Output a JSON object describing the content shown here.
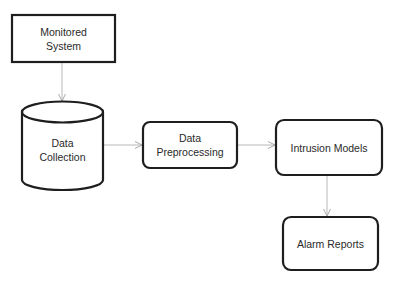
{
  "diagram": {
    "colors": {
      "node_stroke": "#1e1e1e",
      "node_fill": "#ffffff",
      "edge_stroke": "#b8b8b8",
      "text": "#2a2a2a",
      "background": "#ffffff"
    },
    "nodes": [
      {
        "id": "monitored-system",
        "shape": "rectangle",
        "label": "Monitored\nSystem"
      },
      {
        "id": "data-collection",
        "shape": "cylinder",
        "label": "Data\nCollection"
      },
      {
        "id": "data-preprocessing",
        "shape": "rounded-rectangle",
        "label": "Data\nPreprocessing"
      },
      {
        "id": "intrusion-models",
        "shape": "rounded-rectangle",
        "label": "Intrusion Models"
      },
      {
        "id": "alarm-reports",
        "shape": "rounded-rectangle",
        "label": "Alarm Reports"
      }
    ],
    "edges": [
      {
        "from": "monitored-system",
        "to": "data-collection"
      },
      {
        "from": "data-collection",
        "to": "data-preprocessing"
      },
      {
        "from": "data-preprocessing",
        "to": "intrusion-models"
      },
      {
        "from": "intrusion-models",
        "to": "alarm-reports"
      }
    ]
  }
}
